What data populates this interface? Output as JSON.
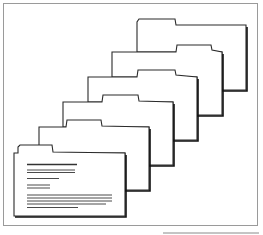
{
  "diagram": {
    "title": "",
    "colors": {
      "background": "#ffffff",
      "outline": "#2a2a2a",
      "frame": "#9a9a9a"
    },
    "folder_count": 6,
    "front_folder_text_lines": 9
  }
}
